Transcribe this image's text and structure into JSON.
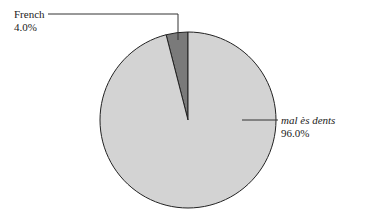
{
  "chart_data": {
    "type": "pie",
    "title": "",
    "categories": [
      "French",
      "mal ès dents"
    ],
    "values": [
      4.0,
      96.0
    ],
    "labels": [
      {
        "name": "French",
        "percent": "4.0%",
        "italic": false
      },
      {
        "name": "mal ès dents",
        "percent": "96.0%",
        "italic": true
      }
    ],
    "colors": [
      "#7a7a7a",
      "#d3d3d3"
    ],
    "outline_color": "#222222",
    "start_angle_deg": 0,
    "direction": "counterclockwise-from-top-for-first-slice",
    "legend": "none",
    "label_style": "leader-lines"
  }
}
